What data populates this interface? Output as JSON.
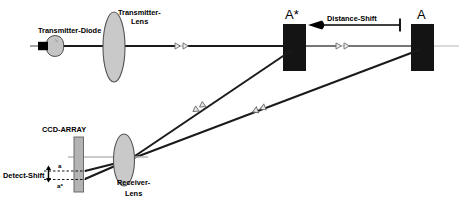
{
  "figure": {
    "type": "optical-triangulation-diagram",
    "background_color": "#ffffff",
    "width": 459,
    "height": 210
  },
  "labels": {
    "transmitter_diode": "Transmitter-Diode",
    "transmitter_lens_line1": "Transmitter-",
    "transmitter_lens_line2": "Lens",
    "target_shifted": "A*",
    "target_reference": "A",
    "distance_shift": "Distance-Shift",
    "ccd_array": "CCD-ARRAY",
    "detect_shift": "Detect-Shift",
    "spot_reference": "a",
    "spot_shifted": "a*",
    "receiver_lens_line1": "Receiver-",
    "receiver_lens_line2": "Lens"
  },
  "colors": {
    "ink": "#000000",
    "beam": "#1a1a1a",
    "axis_gray": "#b8b8b8",
    "lens_fill": "#c9c9c9",
    "lens_stroke": "#555555",
    "diode_bulb_fill": "#c4c4c4",
    "diode_bulb_stroke": "#4a4a4a",
    "diode_cap": "#000000",
    "target_block": "#141414",
    "ccd_fill": "#b3b3b3",
    "ccd_stroke": "#6b6b6b",
    "marker_outline": "#6f6f6f",
    "dashed_guide": "#000000"
  },
  "geometry": {
    "optical_axis_y": 46,
    "transmitter_diode_x": 48,
    "transmitter_lens_x": 114,
    "target_shifted_x": 294,
    "target_reference_x": 421,
    "receiver_lens_x": 124,
    "ccd_array_x": 78,
    "receiver_axis_y": 157
  },
  "icons": {
    "beam_marker": "double-arrowhead-right",
    "return_marker": "double-arrowhead-downleft",
    "distance_shift_marker": "solid-arrowhead-left",
    "detect_shift_marker": "double-headed-vertical-arrow"
  }
}
